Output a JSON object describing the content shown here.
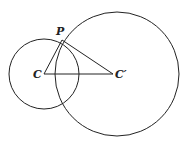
{
  "diagram": {
    "colors": {
      "stroke": "#222222",
      "background": "#ffffff"
    },
    "circles": [
      {
        "name": "circle-C",
        "cx": 44,
        "cy": 74,
        "r": 35
      },
      {
        "name": "circle-C-prime",
        "cx": 117,
        "cy": 74,
        "r": 62
      }
    ],
    "points": {
      "C": {
        "x": 44,
        "y": 74
      },
      "C_prime": {
        "x": 115,
        "y": 74
      },
      "P": {
        "x": 62,
        "y": 40
      }
    },
    "segments": [
      {
        "from": "C",
        "to": "P"
      },
      {
        "from": "P",
        "to": "C_prime"
      },
      {
        "from": "C",
        "to": "C_prime"
      }
    ],
    "labels": {
      "P": "P",
      "C": "C",
      "C_prime": "C′"
    }
  }
}
